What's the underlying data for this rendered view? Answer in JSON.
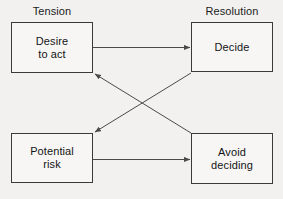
{
  "diagram": {
    "type": "flow-diagram",
    "background_color": "#f2f1ef",
    "line_color": "#4a4a4a",
    "box_border_color": "#3a3a3a",
    "box_fill_color": "#f7f6f4",
    "text_color": "#141414",
    "column_labels": {
      "left": "Tension",
      "right": "Resolution"
    },
    "nodes": [
      {
        "id": "desire",
        "label": "Desire\nto act",
        "column": "Tension",
        "row": "top"
      },
      {
        "id": "decide",
        "label": "Decide",
        "column": "Resolution",
        "row": "top"
      },
      {
        "id": "risk",
        "label": "Potential\nrisk",
        "column": "Tension",
        "row": "bottom"
      },
      {
        "id": "avoid",
        "label": "Avoid\ndeciding",
        "column": "Resolution",
        "row": "bottom"
      }
    ],
    "edges": [
      {
        "id": "desire-to-decide",
        "from": "desire",
        "to": "decide",
        "style": "straight-horizontal",
        "arrow": "end"
      },
      {
        "id": "risk-to-avoid",
        "from": "risk",
        "to": "avoid",
        "style": "straight-horizontal",
        "arrow": "end"
      },
      {
        "id": "avoid-to-desire",
        "from": "avoid",
        "to": "desire",
        "style": "diagonal",
        "arrow": "end"
      },
      {
        "id": "decide-to-risk",
        "from": "decide",
        "to": "risk",
        "style": "diagonal",
        "arrow": "end"
      }
    ]
  }
}
